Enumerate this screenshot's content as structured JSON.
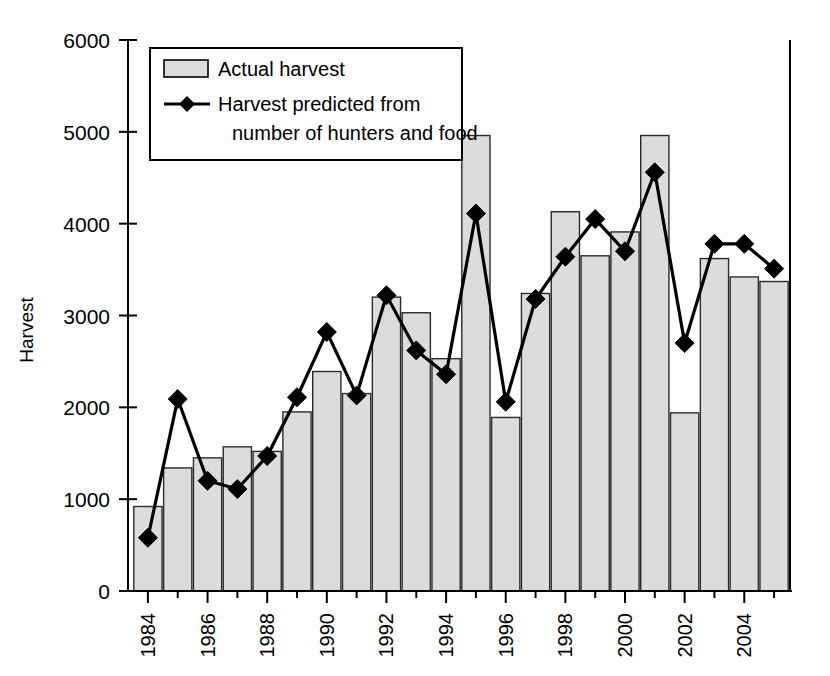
{
  "chart_data": {
    "type": "bar",
    "title": "",
    "xlabel": "",
    "ylabel": "Harvest",
    "ylim": [
      0,
      6000
    ],
    "ytick_values": [
      0,
      1000,
      2000,
      3000,
      4000,
      5000,
      6000
    ],
    "ytick_labels": [
      "0",
      "1000",
      "2000",
      "3000",
      "4000",
      "5000",
      "6000"
    ],
    "grid": false,
    "legend_position": "upper-left-inside",
    "categories": [
      1984,
      1985,
      1986,
      1987,
      1988,
      1989,
      1990,
      1991,
      1992,
      1993,
      1994,
      1995,
      1996,
      1997,
      1998,
      1999,
      2000,
      2001,
      2002,
      2003,
      2004,
      2005
    ],
    "xtick_labels": [
      "1984",
      "1986",
      "1988",
      "1990",
      "1992",
      "1994",
      "1996",
      "1998",
      "2000",
      "2002",
      "2004"
    ],
    "xtick_categories": [
      1984,
      1986,
      1988,
      1990,
      1992,
      1994,
      1996,
      1998,
      2000,
      2002,
      2004
    ],
    "xtick_rotation": 90,
    "series": [
      {
        "name": "Actual harvest",
        "kind": "bar",
        "color": "#dcdcdc",
        "edge_color": "#2b2b2b",
        "values": [
          920,
          1340,
          1450,
          1570,
          1520,
          1950,
          2390,
          2150,
          3200,
          3030,
          2530,
          4960,
          1890,
          3240,
          4130,
          3650,
          3910,
          4960,
          1940,
          3620,
          3420,
          3370
        ]
      },
      {
        "name": "Harvest predicted from number of hunters and food",
        "kind": "line",
        "color": "#000000",
        "marker": "diamond",
        "values": [
          580,
          2090,
          1200,
          1110,
          1470,
          2110,
          2820,
          2130,
          3220,
          2620,
          2360,
          4110,
          2060,
          3180,
          3640,
          4050,
          3700,
          4560,
          2700,
          3780,
          3780,
          3510
        ]
      }
    ]
  },
  "legend": {
    "items": [
      {
        "label": "Actual harvest",
        "type": "swatch"
      },
      {
        "label": "Harvest predicted from",
        "label2": "number of hunters and food",
        "type": "line-marker"
      }
    ]
  },
  "axes": {
    "y_title": "Harvest"
  }
}
